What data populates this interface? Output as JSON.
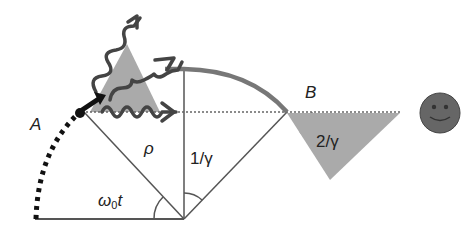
{
  "diagram": {
    "type": "synchrotron-radiation-geometry",
    "labels": {
      "point_a": "A",
      "point_b": "B",
      "radius": "ρ",
      "angle_omega": "ω",
      "angle_omega_sub": "0",
      "angle_omega_t": "t",
      "angle_half_cone": "1/γ",
      "angle_cone": "2/γ"
    },
    "colors": {
      "line": "#555555",
      "arc_thick": "#777777",
      "cone_fill": "#aaaaaa",
      "photon": "#555555",
      "particle": "#111111",
      "observer": "#666666"
    },
    "elements": [
      "orbit-dotted-arc",
      "orbit-thick-arc",
      "radius-lines",
      "emission-cone-at-A",
      "emission-cone-at-B",
      "photon-wavy-arrows",
      "particle-arrow",
      "line-of-sight",
      "observer-face"
    ]
  }
}
